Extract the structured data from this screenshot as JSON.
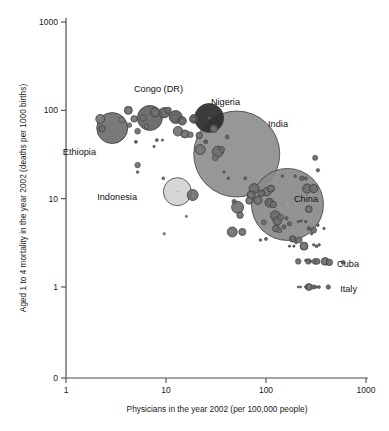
{
  "chart_data": {
    "type": "scatter",
    "title": "",
    "xlabel": "Physicians in the year 2002 (per 100,000 people)",
    "ylabel": "Aged 1 to 4 mortality in the year 2002 (deaths per 1000 births)",
    "xscale": "log",
    "yscale": "log",
    "xlim": [
      1,
      1000
    ],
    "ylim": [
      1,
      1000
    ],
    "xticks": [
      "1",
      "10",
      "100",
      "1000"
    ],
    "xtick_values": [
      1,
      10,
      100,
      1000
    ],
    "yticks": [
      "1000",
      "100",
      "10",
      "1",
      "0"
    ],
    "ytick_values": [
      1000,
      100,
      10,
      1,
      0
    ],
    "grid": false,
    "legend": "none",
    "size_encoding": "population",
    "annotations": [
      {
        "label": "Ethiopia",
        "x": 2.9,
        "y": 63,
        "lx": 96,
        "ly": 155
      },
      {
        "label": "Congo (DR)",
        "x": 6.9,
        "y": 82,
        "lx": 183,
        "ly": 92
      },
      {
        "label": "Nigeria",
        "x": 27,
        "y": 82,
        "lx": 240,
        "ly": 105
      },
      {
        "label": "India",
        "x": 51,
        "y": 32,
        "lx": 288,
        "ly": 127
      },
      {
        "label": "Indonesia",
        "x": 13,
        "y": 12,
        "lx": 137,
        "ly": 200
      },
      {
        "label": "China",
        "x": 164,
        "y": 8.6,
        "lx": 318,
        "ly": 202
      },
      {
        "label": "Cuba",
        "x": 590,
        "y": 1.9,
        "lx": 359,
        "ly": 267
      },
      {
        "label": "Italy",
        "x": 420,
        "y": 1.0,
        "lx": 357,
        "ly": 292
      }
    ],
    "points": [
      {
        "name": "Ethiopia",
        "x": 2.9,
        "y": 63,
        "r": 15.5,
        "fill": "#6e6e6e",
        "labeled": true
      },
      {
        "name": "Congo (DR)",
        "x": 6.9,
        "y": 82,
        "r": 12.5,
        "fill": "#636363",
        "labeled": true
      },
      {
        "name": "Nigeria",
        "x": 27,
        "y": 82,
        "r": 14.5,
        "fill": "#2b2b2b",
        "labeled": true
      },
      {
        "name": "India",
        "x": 51,
        "y": 32,
        "r": 43.0,
        "fill": "#8e8e8e",
        "labeled": true
      },
      {
        "name": "Indonesia",
        "x": 13,
        "y": 12,
        "r": 14.0,
        "fill": "#d2d2d2",
        "labeled": true
      },
      {
        "name": "China",
        "x": 164,
        "y": 8.6,
        "r": 36.0,
        "fill": "#8a8a8a",
        "labeled": true
      },
      {
        "name": "Cuba",
        "x": 590,
        "y": 1.9,
        "r": 2.0,
        "fill": "#5c5c5c",
        "labeled": true
      },
      {
        "name": "Italy",
        "x": 420,
        "y": 1.0,
        "r": 2.2,
        "fill": "#5c5c5c",
        "labeled": true
      },
      {
        "name": "p01",
        "x": 2.2,
        "y": 80,
        "r": 4.5,
        "fill": "#787878"
      },
      {
        "name": "p02",
        "x": 3.6,
        "y": 78,
        "r": 3.0,
        "fill": "#7a7a7a"
      },
      {
        "name": "p03",
        "x": 2.3,
        "y": 62,
        "r": 3.2,
        "fill": "#707070"
      },
      {
        "name": "p04",
        "x": 4.2,
        "y": 100,
        "r": 4.0,
        "fill": "#6b6b6b"
      },
      {
        "name": "p05",
        "x": 4.8,
        "y": 80,
        "r": 3.2,
        "fill": "#757575"
      },
      {
        "name": "p06",
        "x": 5.9,
        "y": 82,
        "r": 3.0,
        "fill": "#727272"
      },
      {
        "name": "p07",
        "x": 4.3,
        "y": 68,
        "r": 2.4,
        "fill": "#6e6e6e"
      },
      {
        "name": "p08",
        "x": 5.2,
        "y": 58,
        "r": 2.9,
        "fill": "#6e6e6e"
      },
      {
        "name": "p09",
        "x": 6.4,
        "y": 66,
        "r": 2.3,
        "fill": "#717171"
      },
      {
        "name": "p10",
        "x": 7.8,
        "y": 95,
        "r": 4.6,
        "fill": "#6d6d6d"
      },
      {
        "name": "p11",
        "x": 9.6,
        "y": 94,
        "r": 5.2,
        "fill": "#626262"
      },
      {
        "name": "p12",
        "x": 10.5,
        "y": 100,
        "r": 3.2,
        "fill": "#6a6a6a"
      },
      {
        "name": "p13",
        "x": 12.5,
        "y": 84,
        "r": 6.5,
        "fill": "#5b5b5b"
      },
      {
        "name": "p14",
        "x": 14.5,
        "y": 76,
        "r": 4.2,
        "fill": "#5f5f5f"
      },
      {
        "name": "p15",
        "x": 13.2,
        "y": 58,
        "r": 4.8,
        "fill": "#707070"
      },
      {
        "name": "p16",
        "x": 15.5,
        "y": 54,
        "r": 4.0,
        "fill": "#6b6b6b"
      },
      {
        "name": "p17",
        "x": 17.5,
        "y": 53,
        "r": 3.0,
        "fill": "#6e6e6e"
      },
      {
        "name": "p18",
        "x": 19,
        "y": 80,
        "r": 4.3,
        "fill": "#555555"
      },
      {
        "name": "p19",
        "x": 8.1,
        "y": 46,
        "r": 1.5,
        "fill": "#555555"
      },
      {
        "name": "p20",
        "x": 9.2,
        "y": 46,
        "r": 1.2,
        "fill": "#555555"
      },
      {
        "name": "p21",
        "x": 5.0,
        "y": 44,
        "r": 1.6,
        "fill": "#555555"
      },
      {
        "name": "p22",
        "x": 5.2,
        "y": 24,
        "r": 2.8,
        "fill": "#6d6d6d"
      },
      {
        "name": "p23",
        "x": 5.2,
        "y": 20,
        "r": 1.4,
        "fill": "#5a5a5a"
      },
      {
        "name": "p24",
        "x": 9.4,
        "y": 17,
        "r": 1.5,
        "fill": "#6a6a6a"
      },
      {
        "name": "p25",
        "x": 9.6,
        "y": 4.0,
        "r": 1.2,
        "fill": "#777777"
      },
      {
        "name": "p26",
        "x": 18.5,
        "y": 11,
        "r": 5.5,
        "fill": "#6f6f6f"
      },
      {
        "name": "p27",
        "x": 22,
        "y": 36,
        "r": 5.0,
        "fill": "#727272"
      },
      {
        "name": "p28",
        "x": 21.5,
        "y": 52,
        "r": 3.2,
        "fill": "#6e6e6e"
      },
      {
        "name": "p29",
        "x": 25,
        "y": 44,
        "r": 2.0,
        "fill": "#5a5a5a"
      },
      {
        "name": "p30",
        "x": 30,
        "y": 62,
        "r": 3.8,
        "fill": "#6b6b6b"
      },
      {
        "name": "p31",
        "x": 33,
        "y": 34,
        "r": 5.5,
        "fill": "#6c6c6c"
      },
      {
        "name": "p32",
        "x": 36,
        "y": 36,
        "r": 3.0,
        "fill": "#6a6a6a"
      },
      {
        "name": "p33",
        "x": 31,
        "y": 29,
        "r": 3.0,
        "fill": "#6f6f6f"
      },
      {
        "name": "p34",
        "x": 41,
        "y": 50,
        "r": 2.0,
        "fill": "#5f5f5f"
      },
      {
        "name": "p35",
        "x": 48,
        "y": 9.3,
        "r": 2.2,
        "fill": "#606060"
      },
      {
        "name": "p36",
        "x": 52,
        "y": 8.0,
        "r": 6.0,
        "fill": "#707070"
      },
      {
        "name": "p37",
        "x": 55,
        "y": 6.5,
        "r": 3.2,
        "fill": "#6e6e6e"
      },
      {
        "name": "p38",
        "x": 46,
        "y": 4.2,
        "r": 5.0,
        "fill": "#6d6d6d"
      },
      {
        "name": "p39",
        "x": 58,
        "y": 4.2,
        "r": 3.5,
        "fill": "#707070"
      },
      {
        "name": "p40",
        "x": 71,
        "y": 11,
        "r": 4.0,
        "fill": "#6a6a6a"
      },
      {
        "name": "p41",
        "x": 76,
        "y": 13,
        "r": 5.0,
        "fill": "#6b6b6b"
      },
      {
        "name": "p42",
        "x": 83,
        "y": 9.6,
        "r": 4.2,
        "fill": "#6e6e6e"
      },
      {
        "name": "p43",
        "x": 90,
        "y": 11.5,
        "r": 3.2,
        "fill": "#6c6c6c"
      },
      {
        "name": "p44",
        "x": 68,
        "y": 9.5,
        "r": 3.5,
        "fill": "#717171"
      },
      {
        "name": "p45",
        "x": 95,
        "y": 5.4,
        "r": 2.5,
        "fill": "#686868"
      },
      {
        "name": "p46",
        "x": 102,
        "y": 12,
        "r": 4.2,
        "fill": "#6b6b6b"
      },
      {
        "name": "p47",
        "x": 112,
        "y": 13,
        "r": 3.6,
        "fill": "#6d6d6d"
      },
      {
        "name": "p48",
        "x": 108,
        "y": 9.0,
        "r": 4.4,
        "fill": "#646464"
      },
      {
        "name": "p49",
        "x": 118,
        "y": 8.6,
        "r": 3.2,
        "fill": "#6e6e6e"
      },
      {
        "name": "p50",
        "x": 124,
        "y": 6.4,
        "r": 5.0,
        "fill": "#6a6a6a"
      },
      {
        "name": "p51",
        "x": 130,
        "y": 5.6,
        "r": 4.2,
        "fill": "#6d6d6d"
      },
      {
        "name": "p52",
        "x": 140,
        "y": 6.2,
        "r": 3.0,
        "fill": "#6f6f6f"
      },
      {
        "name": "p53",
        "x": 126,
        "y": 4.6,
        "r": 3.4,
        "fill": "#6b6b6b"
      },
      {
        "name": "p54",
        "x": 136,
        "y": 4.4,
        "r": 2.6,
        "fill": "#6c6c6c"
      },
      {
        "name": "p55",
        "x": 100,
        "y": 3.5,
        "r": 1.6,
        "fill": "#5f5f5f"
      },
      {
        "name": "p56",
        "x": 88,
        "y": 3.4,
        "r": 1.4,
        "fill": "#5f5f5f"
      },
      {
        "name": "p57",
        "x": 152,
        "y": 4.8,
        "r": 2.0,
        "fill": "#606060"
      },
      {
        "name": "p58",
        "x": 160,
        "y": 6.0,
        "r": 1.8,
        "fill": "#606060"
      },
      {
        "name": "p59",
        "x": 172,
        "y": 5.2,
        "r": 2.2,
        "fill": "#646464"
      },
      {
        "name": "p60",
        "x": 185,
        "y": 3.5,
        "r": 3.2,
        "fill": "#6a6a6a"
      },
      {
        "name": "p61",
        "x": 200,
        "y": 3.2,
        "r": 1.5,
        "fill": "#5e5e5e"
      },
      {
        "name": "p62",
        "x": 215,
        "y": 3.4,
        "r": 3.0,
        "fill": "#6b6b6b"
      },
      {
        "name": "p63",
        "x": 240,
        "y": 2.9,
        "r": 4.0,
        "fill": "#6a6a6a"
      },
      {
        "name": "p64",
        "x": 268,
        "y": 7.6,
        "r": 3.4,
        "fill": "#6d6d6d"
      },
      {
        "name": "p65",
        "x": 258,
        "y": 13,
        "r": 4.6,
        "fill": "#6a6a6a"
      },
      {
        "name": "p66",
        "x": 300,
        "y": 13,
        "r": 4.2,
        "fill": "#6c6c6c"
      },
      {
        "name": "p67",
        "x": 310,
        "y": 29,
        "r": 2.6,
        "fill": "#666666"
      },
      {
        "name": "p68",
        "x": 330,
        "y": 21,
        "r": 1.8,
        "fill": "#5d5d5d"
      },
      {
        "name": "p69",
        "x": 250,
        "y": 17,
        "r": 1.6,
        "fill": "#5d5d5d"
      },
      {
        "name": "p70",
        "x": 228,
        "y": 17,
        "r": 2.4,
        "fill": "#666666"
      },
      {
        "name": "p71",
        "x": 196,
        "y": 18,
        "r": 1.3,
        "fill": "#5a5a5a"
      },
      {
        "name": "p72",
        "x": 210,
        "y": 5.5,
        "r": 1.2,
        "fill": "#585858"
      },
      {
        "name": "p73",
        "x": 224,
        "y": 5.6,
        "r": 1.2,
        "fill": "#585858"
      },
      {
        "name": "p74",
        "x": 250,
        "y": 5.5,
        "r": 1.3,
        "fill": "#585858"
      },
      {
        "name": "p75",
        "x": 268,
        "y": 4.6,
        "r": 1.9,
        "fill": "#606060"
      },
      {
        "name": "p76",
        "x": 285,
        "y": 4.0,
        "r": 1.3,
        "fill": "#585858"
      },
      {
        "name": "p77",
        "x": 300,
        "y": 4.4,
        "r": 3.0,
        "fill": "#6a6a6a"
      },
      {
        "name": "p78",
        "x": 330,
        "y": 5.0,
        "r": 1.4,
        "fill": "#5c5c5c"
      },
      {
        "name": "p79",
        "x": 300,
        "y": 3.0,
        "r": 1.3,
        "fill": "#5a5a5a"
      },
      {
        "name": "p80",
        "x": 340,
        "y": 3.0,
        "r": 1.3,
        "fill": "#5a5a5a"
      },
      {
        "name": "p81",
        "x": 310,
        "y": 1.95,
        "r": 3.0,
        "fill": "#6b6b6b"
      },
      {
        "name": "p82",
        "x": 325,
        "y": 1.95,
        "r": 3.0,
        "fill": "#6b6b6b"
      },
      {
        "name": "p83",
        "x": 390,
        "y": 1.95,
        "r": 3.8,
        "fill": "#6d6d6d"
      },
      {
        "name": "p84",
        "x": 430,
        "y": 1.9,
        "r": 3.2,
        "fill": "#6c6c6c"
      },
      {
        "name": "p85",
        "x": 210,
        "y": 1.95,
        "r": 2.8,
        "fill": "#696969"
      },
      {
        "name": "p86",
        "x": 265,
        "y": 1.95,
        "r": 2.8,
        "fill": "#696969"
      },
      {
        "name": "p87",
        "x": 280,
        "y": 1.95,
        "r": 1.2,
        "fill": "#575757"
      },
      {
        "name": "p88",
        "x": 250,
        "y": 2.0,
        "r": 1.3,
        "fill": "#575757"
      },
      {
        "name": "p89",
        "x": 210,
        "y": 1.0,
        "r": 1.1,
        "fill": "#575757"
      },
      {
        "name": "p90",
        "x": 222,
        "y": 1.0,
        "r": 1.1,
        "fill": "#575757"
      },
      {
        "name": "p91",
        "x": 250,
        "y": 1.0,
        "r": 1.4,
        "fill": "#5c5c5c"
      },
      {
        "name": "p92",
        "x": 268,
        "y": 1.0,
        "r": 3.4,
        "fill": "#6c6c6c"
      },
      {
        "name": "p93",
        "x": 300,
        "y": 1.0,
        "r": 2.2,
        "fill": "#616161"
      },
      {
        "name": "p94",
        "x": 318,
        "y": 1.0,
        "r": 1.3,
        "fill": "#595959"
      },
      {
        "name": "p95",
        "x": 338,
        "y": 1.0,
        "r": 1.6,
        "fill": "#5d5d5d"
      },
      {
        "name": "p96",
        "x": 320,
        "y": 2.9,
        "r": 1.5,
        "fill": "#5b5b5b"
      },
      {
        "name": "p97",
        "x": 380,
        "y": 4.6,
        "r": 1.3,
        "fill": "#5a5a5a"
      },
      {
        "name": "p98",
        "x": 16,
        "y": 6.3,
        "r": 1.1,
        "fill": "#707070"
      },
      {
        "name": "p99",
        "x": 42,
        "y": 17,
        "r": 1.4,
        "fill": "#5d5d5d"
      },
      {
        "name": "p100",
        "x": 62,
        "y": 17,
        "r": 1.5,
        "fill": "#5d5d5d"
      },
      {
        "name": "p101",
        "x": 7.6,
        "y": 39,
        "r": 1.2,
        "fill": "#555555"
      },
      {
        "name": "p102",
        "x": 38,
        "y": 20,
        "r": 1.2,
        "fill": "#585858"
      },
      {
        "name": "p103",
        "x": 146,
        "y": 18,
        "r": 1.3,
        "fill": "#5a5a5a"
      },
      {
        "name": "p104",
        "x": 172,
        "y": 2.9,
        "r": 1.2,
        "fill": "#585858"
      },
      {
        "name": "p105",
        "x": 190,
        "y": 2.9,
        "r": 1.2,
        "fill": "#585858"
      }
    ]
  },
  "axes": {
    "x_title": "Physicians in the year 2002 (per 100,000 people)",
    "y_title": "Aged 1 to 4 mortality in the year 2002 (deaths per 1000 births)",
    "x_tick_labels": [
      "1",
      "10",
      "100",
      "1000"
    ],
    "y_tick_labels": [
      "1000",
      "100",
      "10",
      "1",
      "0"
    ]
  },
  "colors": {
    "background": "#ffffff",
    "axis": "#4a4a4a",
    "text": "#1a1a1a",
    "bubble_default": "#6e6e6e",
    "bubble_stroke": "#3c3c3c",
    "bubble_dark": "#2b2b2b",
    "bubble_light": "#d2d2d2"
  }
}
